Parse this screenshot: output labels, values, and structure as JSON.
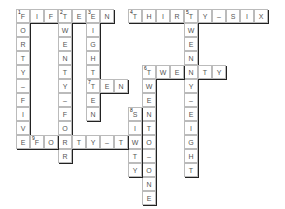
{
  "puzzle": {
    "type": "crossword",
    "cell_size": 14,
    "origin": {
      "x": 16,
      "y": 9
    },
    "words": [
      {
        "number": 1,
        "direction": "across",
        "row": 0,
        "col": 0,
        "answer": "FIFTEEN"
      },
      {
        "number": 1,
        "direction": "down",
        "row": 0,
        "col": 0,
        "answer": "FORTY-FIVE"
      },
      {
        "number": 2,
        "direction": "down",
        "row": 0,
        "col": 3,
        "answer": "TWENTY-FOUR"
      },
      {
        "number": 3,
        "direction": "down",
        "row": 0,
        "col": 5,
        "answer": "EIGHTEEN"
      },
      {
        "number": 4,
        "direction": "across",
        "row": 0,
        "col": 8,
        "answer": "THIRTY-SIX"
      },
      {
        "number": 5,
        "direction": "down",
        "row": 0,
        "col": 12,
        "answer": "TWENTY-EIGHT"
      },
      {
        "number": 6,
        "direction": "across",
        "row": 4,
        "col": 9,
        "answer": "TWENTY"
      },
      {
        "number": 6,
        "direction": "down",
        "row": 4,
        "col": 9,
        "answer": "TWENTY-ONE"
      },
      {
        "number": 7,
        "direction": "across",
        "row": 5,
        "col": 5,
        "answer": "TEN"
      },
      {
        "number": 8,
        "direction": "down",
        "row": 7,
        "col": 8,
        "answer": "SIXTY"
      },
      {
        "number": 9,
        "direction": "across",
        "row": 9,
        "col": 1,
        "answer": "FORTY-TWO"
      }
    ]
  }
}
